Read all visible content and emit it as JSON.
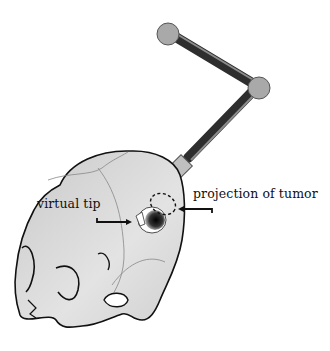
{
  "figure": {
    "labels": {
      "virtual_tip": "virtual tip",
      "projection": "projection of tumor"
    },
    "components": {
      "robot_arm": "robotic-arm",
      "skull": "skull",
      "needle": "needle",
      "tumor_projection": "dashed-ellipse",
      "virtual_tip": "burr-hole"
    },
    "colors": {
      "skull_fill": "#d9d9d9",
      "outline": "#111111",
      "joint": "#a8a8a8",
      "link": "#3a3a3a",
      "effector": "#bdbdbd"
    }
  }
}
